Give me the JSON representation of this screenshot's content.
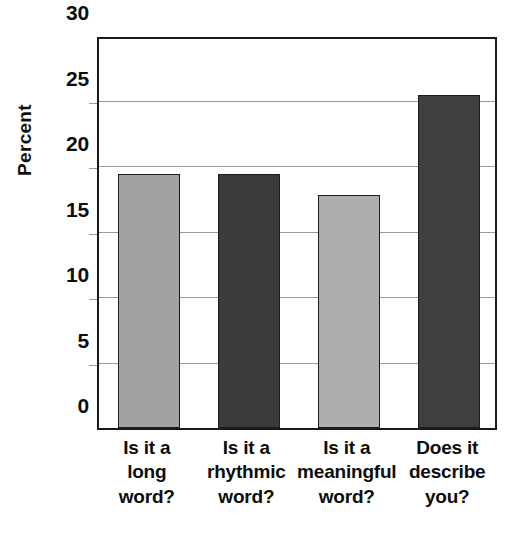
{
  "chart_data": {
    "type": "bar",
    "title": "",
    "subtitle": "",
    "xlabel": "",
    "ylabel": "Percent",
    "ylim": [
      0,
      30
    ],
    "ytick_labels": [
      "0",
      "5",
      "10",
      "15",
      "20",
      "25",
      "30"
    ],
    "ytick_values": [
      0,
      5,
      10,
      15,
      20,
      25,
      30
    ],
    "gridlines": [
      5,
      10,
      15,
      20,
      25
    ],
    "grid": true,
    "legend": "none",
    "categories": [
      "Is it a long word?",
      "Is it a rhythmic word?",
      "Is it a meaningful word?",
      "Does it describe you?"
    ],
    "category_lines": [
      [
        "Is it a",
        "long",
        "word?"
      ],
      [
        "Is it a",
        "rhythmic",
        "word?"
      ],
      [
        "Is it a",
        "meaningful",
        "word?"
      ],
      [
        "Does it",
        "describe",
        "you?"
      ]
    ],
    "values": [
      19.4,
      19.4,
      17.8,
      25.4
    ],
    "bar_colors": [
      "#a2a2a2",
      "#3b3b3b",
      "#aeaeae",
      "#3f3f3f"
    ],
    "bar_edge_color": "#1c1c1c",
    "axis_color": "#1a1a1a",
    "grid_color": "#9a9a9a",
    "background_color": "#ffffff",
    "text_color": "#0d0d0d"
  }
}
